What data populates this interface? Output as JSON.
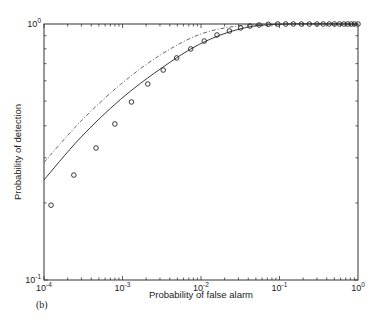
{
  "chart_data": {
    "type": "line",
    "title": "",
    "panel_label": "(b)",
    "xlabel": "Probability of false alarm",
    "ylabel": "Probability of detection",
    "xscale": "log",
    "yscale": "log",
    "xlim": [
      0.0001,
      1
    ],
    "ylim": [
      0.1,
      1
    ],
    "grid": false,
    "legend": null,
    "x_ticks": [
      {
        "base": "10",
        "exp": "-4",
        "value": 0.0001
      },
      {
        "base": "10",
        "exp": "-3",
        "value": 0.001
      },
      {
        "base": "10",
        "exp": "-2",
        "value": 0.01
      },
      {
        "base": "10",
        "exp": "-1",
        "value": 0.1
      },
      {
        "base": "10",
        "exp": "0",
        "value": 1
      }
    ],
    "y_ticks": [
      {
        "base": "10",
        "exp": "-1",
        "value": 0.1
      },
      {
        "base": "10",
        "exp": "0",
        "value": 1
      }
    ],
    "series": [
      {
        "name": "solid-curve",
        "style": "solid",
        "x": [
          0.0001,
          0.00029,
          0.00094,
          0.003,
          0.0096,
          0.031,
          0.1,
          1
        ],
        "y": [
          0.246,
          0.359,
          0.507,
          0.666,
          0.834,
          0.956,
          0.998,
          1.0
        ]
      },
      {
        "name": "dash-dot-curve",
        "style": "dashdot",
        "x": [
          0.0001,
          0.00029,
          0.00094,
          0.003,
          0.0096,
          0.031,
          0.1,
          1
        ],
        "y": [
          0.288,
          0.415,
          0.58,
          0.755,
          0.91,
          0.985,
          1.0,
          1.0
        ]
      },
      {
        "name": "circle-markers",
        "style": "markers",
        "marker": "circle",
        "x": [
          0.000123,
          0.00024,
          0.00046,
          0.0008,
          0.0013,
          0.0021,
          0.0033,
          0.0049,
          0.0074,
          0.011,
          0.016,
          0.023,
          0.032,
          0.042,
          0.055,
          0.072,
          0.095,
          0.12,
          0.15,
          0.19,
          0.24,
          0.3,
          0.36,
          0.43,
          0.5,
          0.58,
          0.66,
          0.74,
          0.82,
          0.9,
          1.0
        ],
        "y": [
          0.196,
          0.257,
          0.328,
          0.407,
          0.496,
          0.583,
          0.661,
          0.737,
          0.799,
          0.858,
          0.906,
          0.939,
          0.965,
          0.982,
          0.991,
          0.997,
          1.0,
          1.0,
          1.0,
          1.0,
          1.0,
          1.0,
          1.0,
          1.0,
          1.0,
          1.0,
          1.0,
          1.0,
          1.0,
          1.0,
          1.0
        ]
      }
    ]
  }
}
